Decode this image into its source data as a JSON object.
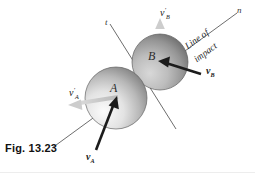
{
  "figure": {
    "caption": "Fig. 13.23",
    "background_color": "#ffffff"
  },
  "axes": {
    "tangent_label": "t",
    "normal_label": "n",
    "line_of_impact": {
      "line1": "Line of",
      "line2": "impact"
    },
    "line_color": "#5a5a5a"
  },
  "spheres": [
    {
      "name": "sphere-a",
      "label": "A",
      "cx": 116,
      "cy": 98,
      "r": 31,
      "fill_light": "#f2f2f2",
      "fill_dark": "#8d8d8d"
    },
    {
      "name": "sphere-b",
      "label": "B",
      "cx": 160,
      "cy": 62,
      "r": 28,
      "fill_light": "#c9c9c9",
      "fill_dark": "#6e6e6e"
    }
  ],
  "vectors": [
    {
      "name": "v-a",
      "label_v": "v",
      "label_sub": "A",
      "label_prime": "",
      "color": "#1c1c1c",
      "style": "incoming"
    },
    {
      "name": "v-b",
      "label_v": "v",
      "label_sub": "B",
      "label_prime": "",
      "color": "#1c1c1c",
      "style": "incoming"
    },
    {
      "name": "v-a-prime",
      "label_v": "v",
      "label_sub": "A",
      "label_prime": "′",
      "color": "#cdcdcd",
      "style": "outgoing"
    },
    {
      "name": "v-b-prime",
      "label_v": "v",
      "label_sub": "B",
      "label_prime": "′",
      "color": "#cdcdcd",
      "style": "outgoing"
    }
  ]
}
